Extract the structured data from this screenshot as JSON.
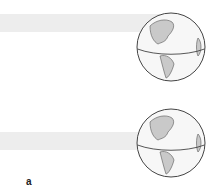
{
  "figure": {
    "panel_label": "a",
    "colors": {
      "band": "#ededed",
      "land": "#c9c9c9",
      "ocean": "#f7f7f7",
      "outline": "#444444"
    },
    "globes": [
      {
        "id": "top",
        "equator": true
      },
      {
        "id": "bottom",
        "equator": true
      }
    ]
  }
}
